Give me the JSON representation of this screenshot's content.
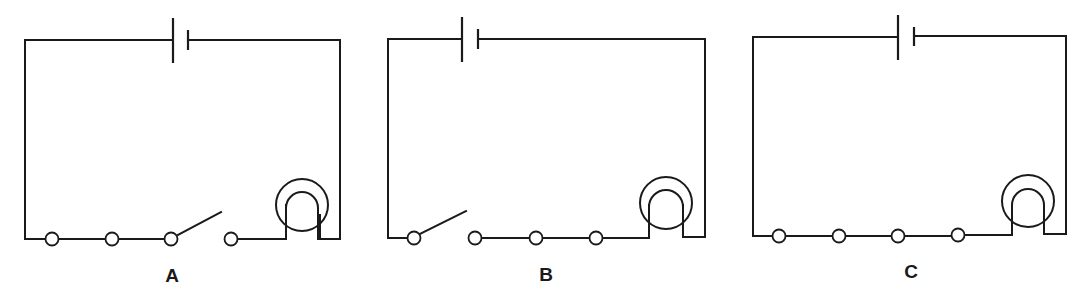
{
  "figure": {
    "colors": {
      "line": "#1a1a1a",
      "background": "#ffffff"
    }
  },
  "circuits": [
    {
      "label": "A",
      "switch_position": "between terminal 3 and terminal 4",
      "switch_state": "open"
    },
    {
      "label": "B",
      "switch_position": "between terminal 1 and terminal 2",
      "switch_state": "open"
    },
    {
      "label": "C",
      "switch_position": "none",
      "switch_state": "closed"
    }
  ]
}
